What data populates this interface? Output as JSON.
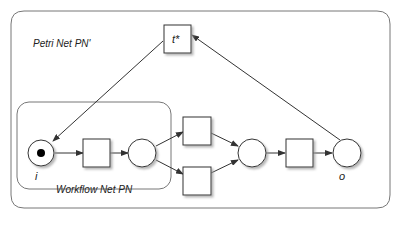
{
  "diagram": {
    "outer_label": "Petri Net PN'",
    "inner_label": "Workflow Net PN",
    "transition_star_label": "t*",
    "source_place_label": "i",
    "sink_place_label": "o",
    "colors": {
      "stroke": "#333333",
      "frame": "#777777",
      "fill": "#ffffff",
      "token": "#000000",
      "shadow": "#c8c8c8"
    },
    "nodes": [
      {
        "id": "i",
        "type": "place",
        "label": "i",
        "tokens": 1
      },
      {
        "id": "t1",
        "type": "transition",
        "label": ""
      },
      {
        "id": "p1",
        "type": "place",
        "label": ""
      },
      {
        "id": "t2",
        "type": "transition",
        "label": ""
      },
      {
        "id": "t3",
        "type": "transition",
        "label": ""
      },
      {
        "id": "p2",
        "type": "place",
        "label": ""
      },
      {
        "id": "t4",
        "type": "transition",
        "label": ""
      },
      {
        "id": "o",
        "type": "place",
        "label": "o"
      },
      {
        "id": "t*",
        "type": "transition",
        "label": "t*"
      }
    ],
    "arcs": [
      [
        "i",
        "t1"
      ],
      [
        "t1",
        "p1"
      ],
      [
        "p1",
        "t2"
      ],
      [
        "p1",
        "t3"
      ],
      [
        "t2",
        "p2"
      ],
      [
        "t3",
        "p2"
      ],
      [
        "p2",
        "t4"
      ],
      [
        "t4",
        "o"
      ],
      [
        "o",
        "t*"
      ],
      [
        "t*",
        "i"
      ]
    ]
  }
}
